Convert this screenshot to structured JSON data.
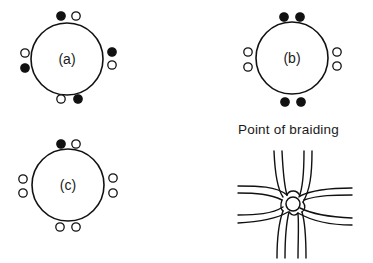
{
  "figure": {
    "caption": "Point of braiding",
    "colors": {
      "stroke": "#111111",
      "filled": "#111111",
      "empty": "#ffffff",
      "background": "#ffffff"
    },
    "diagrams": [
      {
        "id": "a",
        "label": "(a)",
        "center": [
          67,
          59
        ],
        "radius": 36,
        "dots": [
          {
            "x": 61,
            "y": 16,
            "filled": true
          },
          {
            "x": 76,
            "y": 16,
            "filled": false
          },
          {
            "x": 112,
            "y": 52,
            "filled": true
          },
          {
            "x": 112,
            "y": 65,
            "filled": false
          },
          {
            "x": 61,
            "y": 99,
            "filled": false
          },
          {
            "x": 78,
            "y": 99,
            "filled": true
          },
          {
            "x": 25,
            "y": 53,
            "filled": false
          },
          {
            "x": 25,
            "y": 68,
            "filled": true
          }
        ]
      },
      {
        "id": "b",
        "label": "(b)",
        "center": [
          292,
          58
        ],
        "radius": 36,
        "dots": [
          {
            "x": 284,
            "y": 17,
            "filled": true
          },
          {
            "x": 300,
            "y": 17,
            "filled": true
          },
          {
            "x": 337,
            "y": 52,
            "filled": false
          },
          {
            "x": 337,
            "y": 66,
            "filled": false
          },
          {
            "x": 285,
            "y": 102,
            "filled": true
          },
          {
            "x": 301,
            "y": 102,
            "filled": true
          },
          {
            "x": 248,
            "y": 52,
            "filled": false
          },
          {
            "x": 248,
            "y": 67,
            "filled": false
          }
        ]
      },
      {
        "id": "c",
        "label": "(c)",
        "center": [
          68,
          185
        ],
        "radius": 36,
        "dots": [
          {
            "x": 61,
            "y": 144,
            "filled": true
          },
          {
            "x": 76,
            "y": 144,
            "filled": false
          },
          {
            "x": 113,
            "y": 178,
            "filled": false
          },
          {
            "x": 113,
            "y": 193,
            "filled": false
          },
          {
            "x": 60,
            "y": 227,
            "filled": false
          },
          {
            "x": 76,
            "y": 227,
            "filled": false
          },
          {
            "x": 23,
            "y": 179,
            "filled": false
          },
          {
            "x": 23,
            "y": 193,
            "filled": false
          }
        ]
      }
    ],
    "braid": {
      "knot_center": [
        293,
        204
      ],
      "knot_radius": 7
    }
  }
}
